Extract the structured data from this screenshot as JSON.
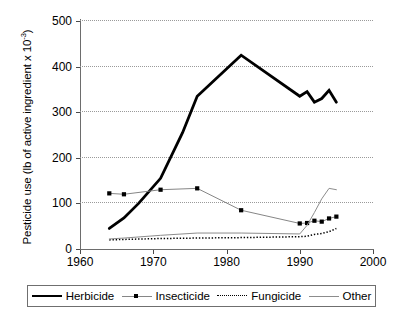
{
  "chart_data": {
    "type": "line",
    "title": "",
    "xlabel": "",
    "ylabel": "Pesticide use (lb of active ingredient x 10⁻³)",
    "ylabel_text": "Pesticide use (lb of active ingredient x 10",
    "ylabel_sup": "-3",
    "ylabel_tail": ")",
    "xlim": [
      1960,
      2000
    ],
    "ylim": [
      0,
      500
    ],
    "grid": true,
    "grid_axis": "y",
    "legend_position": "bottom",
    "x_ticks": [
      1960,
      1970,
      1980,
      1990,
      2000
    ],
    "x_tick_labels": [
      "1960",
      "1970",
      "1980",
      "1990",
      "2000"
    ],
    "y_ticks": [
      0,
      100,
      200,
      300,
      400,
      500
    ],
    "y_tick_labels": [
      "0",
      "100",
      "200",
      "300",
      "400",
      "500"
    ],
    "series": [
      {
        "name": "Herbicide",
        "style": "thick-solid",
        "color": "#000000",
        "marker": "none",
        "x": [
          1964,
          1966,
          1968,
          1971,
          1974,
          1976,
          1982,
          1990,
          1991,
          1992,
          1993,
          1994,
          1995
        ],
        "values": [
          45,
          68,
          100,
          155,
          255,
          335,
          425,
          335,
          345,
          322,
          330,
          348,
          322
        ]
      },
      {
        "name": "Insecticide",
        "style": "thin-solid",
        "color": "#868686",
        "marker": "square",
        "marker_color": "#000000",
        "x": [
          1964,
          1966,
          1971,
          1976,
          1982,
          1990,
          1991,
          1992,
          1993,
          1994,
          1995
        ],
        "values": [
          122,
          120,
          130,
          133,
          85,
          56,
          57,
          62,
          60,
          67,
          71
        ]
      },
      {
        "name": "Fungicide",
        "style": "dotted",
        "color": "#000000",
        "marker": "none",
        "x": [
          1964,
          1966,
          1971,
          1976,
          1982,
          1990,
          1991,
          1992,
          1993,
          1994,
          1995
        ],
        "values": [
          20,
          21,
          23,
          24,
          25,
          27,
          28,
          32,
          34,
          38,
          45
        ]
      },
      {
        "name": "Other",
        "style": "thin-solid",
        "color": "#8c8c8c",
        "marker": "none",
        "x": [
          1964,
          1966,
          1971,
          1976,
          1982,
          1990,
          1991,
          1992,
          1993,
          1994,
          1995
        ],
        "values": [
          22,
          24,
          30,
          35,
          35,
          33,
          52,
          80,
          110,
          133,
          130
        ]
      }
    ]
  },
  "axis": {
    "y_title_full": "Pesticide use (lb of active ingredient x 10",
    "y_title_superscript": "-3",
    "y_title_close": ")",
    "y_tick_labels": [
      "500",
      "400",
      "300",
      "200",
      "100",
      "0"
    ],
    "x_tick_labels": [
      "1960",
      "1970",
      "1980",
      "1990",
      "2000"
    ]
  },
  "legend": {
    "entries": [
      {
        "label": "Herbicide",
        "style": "thick-solid"
      },
      {
        "label": "Insecticide",
        "style": "thin-solid-square"
      },
      {
        "label": "Fungicide",
        "style": "dotted"
      },
      {
        "label": "Other",
        "style": "thin-solid"
      }
    ]
  },
  "colors": {
    "herbicide": "#000000",
    "insecticide": "#000000",
    "insecticide_line": "#868686",
    "fungicide": "#000000",
    "other": "#8c8c8c",
    "grid": "#9a9a9a",
    "axis": "#6d6d6d",
    "background": "#ffffff"
  }
}
